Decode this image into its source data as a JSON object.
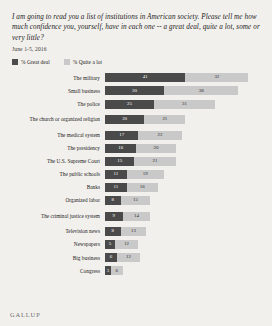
{
  "title": "I am going to read you a list of institutions in American society. Please tell me how much confidence you, yourself, have in each one -- a great deal, quite a lot, some or very little?",
  "subtitle": "June 1-5, 2016",
  "brand": "GALLUP",
  "legend": [
    {
      "label": "% Great deal",
      "color": "#4a4a4a",
      "swatch": "great-deal-swatch"
    },
    {
      "label": "% Quite a lot",
      "color": "#c9c9c9",
      "swatch": "quite-a-lot-swatch"
    }
  ],
  "chart_data": {
    "type": "bar",
    "subtype": "stacked-horizontal",
    "title": "I am going to read you a list of institutions in American society. Please tell me how much confidence you, yourself, have in each one -- a great deal, quite a lot, some or very little?",
    "subtitle": "June 1-5, 2016",
    "xlabel": "",
    "ylabel": "",
    "xlim": [
      0,
      80
    ],
    "grid": false,
    "legend_position": "top-left",
    "categories": [
      "The military",
      "Small business",
      "The police",
      "The church or organized religion",
      "The medical system",
      "The presidency",
      "The U.S. Supreme Court",
      "The public schools",
      "Banks",
      "Organized labor",
      "The criminal justice system",
      "Television news",
      "Newspapers",
      "Big business",
      "Congress"
    ],
    "series": [
      {
        "name": "% Great deal",
        "color": "#4a4a4a",
        "values": [
          41,
          30,
          25,
          20,
          17,
          16,
          15,
          11,
          11,
          8,
          9,
          8,
          5,
          6,
          3
        ]
      },
      {
        "name": "% Quite a lot",
        "color": "#c9c9c9",
        "values": [
          32,
          38,
          31,
          21,
          22,
          20,
          21,
          19,
          16,
          15,
          14,
          13,
          12,
          12,
          6
        ]
      }
    ]
  }
}
